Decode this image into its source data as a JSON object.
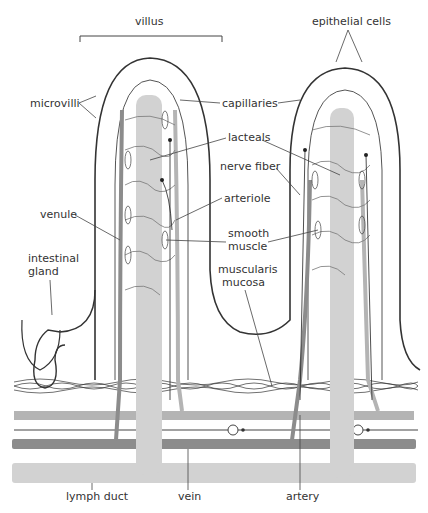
{
  "diagram": {
    "title": "villus",
    "colors": {
      "lymph": "#d2d2d2",
      "vein": "#8c8c8c",
      "artery": "#b4b4b4",
      "outline": "#333333",
      "background": "#ffffff"
    },
    "labels": {
      "villus": "villus",
      "epithelial_cells": "epithelial cells",
      "microvilli": "microvilli",
      "capillaries": "capillaries",
      "lacteals": "lacteals",
      "nerve_fiber": "nerve fiber",
      "venule": "venule",
      "arteriole": "arteriole",
      "smooth_muscle_1": "smooth",
      "smooth_muscle_2": "muscle",
      "intestinal_gland_1": "intestinal",
      "intestinal_gland_2": "gland",
      "muscularis_mucosa_1": "muscularis",
      "muscularis_mucosa_2": "mucosa",
      "lymph_duct": "lymph duct",
      "vein": "vein",
      "artery": "artery"
    }
  }
}
